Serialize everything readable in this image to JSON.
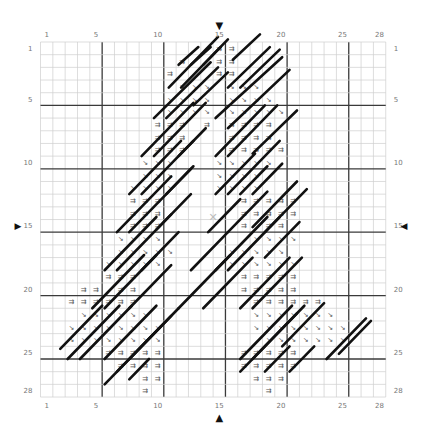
{
  "chart_data": {
    "type": "table",
    "title": "",
    "grid": {
      "cols": 28,
      "rows": 28,
      "bold_every": 5,
      "center_col": 15,
      "center_row": 15
    },
    "col_tick_labels": [
      "1",
      "5",
      "10",
      "15",
      "20",
      "25",
      "28"
    ],
    "row_tick_labels": [
      "1",
      "5",
      "10",
      "15",
      "20",
      "25",
      "28"
    ],
    "symbols": {
      "=": {
        "glyph": "⇉",
        "name": "double-arrow-symbol"
      },
      "\\": {
        "glyph": "↘",
        "name": "diagonal-arrow-symbol"
      }
    },
    "rows": [
      "..............==............",
      "...........=..==............",
      "..........=...==............",
      "...........\\\\\\.\\\\\\..........",
      "..........\\\\\\\\.\\\\\\\\.........",
      "..........\\\\\\\\.\\\\\\\\\\........",
      ".........===.=.====..........",
      ".........===...====.........",
      ".........===...=====........",
      "........\\\\\\...\\\\\\\\\\........",
      "........\\\\\\...\\\\\\\\.........",
      ".......\\\\\\\\...\\\\\\\\.........",
      ".......===......=====.......",
      ".......===......=====.......",
      ".......===......=.==........",
      "......\\\\\\\\.......\\\\\\\\.......",
      "......\\\\\\\\\\....\\\\\\\\\\.......",
      ".....\\\\\\\\\\.....\\\\\\\\\\\\......",
      ".....===........=====.......",
      "...==.==........=====.......",
      "..======.........======.....",
      "...\\\\\\\\\\\\........\\\\\\\\\\\\\\....",
      "..\\\\\\\\\\\\\\\\.......\\\\\\\\\\\\\\\\...",
      "..\\\\\\\\\\\\\\\\........\\\\\\\\\\\\\\...",
      ".....=====......=====.......",
      "......====......=====.......",
      "........==.......===........",
      "........=.........=........."
    ],
    "backstitch_lines": [
      [
        11.2,
        1.8,
        12.8,
        0.4
      ],
      [
        12.2,
        1.8,
        13.8,
        0.4
      ],
      [
        13.2,
        1.8,
        14.6,
        0.4
      ],
      [
        15.6,
        1.4,
        17.8,
        -0.6
      ],
      [
        10.4,
        3.6,
        14.4,
        -0.4
      ],
      [
        11.4,
        3.6,
        15.2,
        -0.2
      ],
      [
        15.2,
        3.6,
        18.6,
        0.4
      ],
      [
        16.2,
        3.6,
        19.4,
        0.6
      ],
      [
        9.2,
        6.0,
        13.8,
        1.6
      ],
      [
        10.2,
        6.0,
        14.4,
        2.0
      ],
      [
        12.4,
        5.0,
        15.2,
        2.4
      ],
      [
        14.2,
        6.0,
        19.6,
        1.2
      ],
      [
        15.2,
        6.8,
        20.2,
        2.2
      ],
      [
        8.2,
        9.0,
        12.4,
        4.8
      ],
      [
        9.2,
        9.0,
        13.4,
        4.8
      ],
      [
        11.2,
        9.0,
        13.4,
        6.8
      ],
      [
        14.2,
        9.0,
        18.2,
        5.0
      ],
      [
        15.2,
        9.0,
        19.2,
        5.0
      ],
      [
        17.2,
        8.8,
        20.8,
        5.4
      ],
      [
        7.2,
        12.0,
        11.4,
        7.8
      ],
      [
        8.2,
        12.0,
        12.4,
        7.8
      ],
      [
        10.2,
        12.0,
        12.4,
        9.8
      ],
      [
        14.2,
        12.0,
        17.4,
        8.8
      ],
      [
        15.2,
        12.0,
        19.4,
        7.8
      ],
      [
        16.2,
        12.0,
        18.4,
        9.8
      ],
      [
        17.2,
        12.0,
        19.6,
        9.6
      ],
      [
        6.2,
        15.0,
        10.6,
        10.6
      ],
      [
        7.2,
        15.0,
        12.2,
        10.0
      ],
      [
        9.4,
        14.8,
        12.2,
        12.0
      ],
      [
        13.6,
        15.0,
        16.2,
        12.4
      ],
      [
        15.2,
        15.0,
        18.4,
        11.8
      ],
      [
        17.2,
        14.6,
        20.8,
        11.0
      ],
      [
        18.2,
        15.0,
        21.6,
        11.6
      ],
      [
        5.2,
        18.0,
        9.4,
        13.8
      ],
      [
        6.2,
        18.0,
        10.6,
        13.6
      ],
      [
        8.2,
        18.0,
        11.2,
        15.0
      ],
      [
        12.2,
        18.0,
        15.2,
        15.0
      ],
      [
        14.2,
        18.0,
        18.4,
        13.8
      ],
      [
        15.2,
        18.0,
        19.4,
        13.8
      ],
      [
        18.2,
        17.0,
        21.0,
        14.2
      ],
      [
        4.2,
        21.0,
        8.4,
        16.8
      ],
      [
        5.2,
        21.0,
        9.4,
        16.8
      ],
      [
        7.2,
        21.0,
        10.6,
        17.6
      ],
      [
        11.2,
        21.0,
        15.4,
        16.8
      ],
      [
        13.2,
        21.0,
        17.2,
        17.0
      ],
      [
        16.2,
        21.0,
        20.2,
        17.0
      ],
      [
        17.2,
        21.0,
        21.2,
        17.0
      ],
      [
        1.6,
        24.2,
        5.0,
        20.8
      ],
      [
        2.2,
        25.0,
        6.4,
        20.8
      ],
      [
        3.2,
        25.0,
        7.4,
        20.8
      ],
      [
        5.2,
        25.0,
        9.4,
        20.8
      ],
      [
        7.2,
        25.0,
        11.2,
        21.0
      ],
      [
        16.2,
        25.0,
        20.4,
        20.8
      ],
      [
        17.2,
        25.0,
        21.4,
        20.8
      ],
      [
        19.6,
        24.0,
        23.0,
        20.6
      ],
      [
        5.2,
        27.0,
        9.8,
        22.4
      ],
      [
        6.2,
        26.0,
        10.6,
        21.6
      ],
      [
        7.2,
        26.6,
        8.8,
        25.0
      ],
      [
        16.2,
        26.0,
        20.8,
        21.4
      ],
      [
        18.2,
        26.0,
        20.2,
        24.0
      ],
      [
        20.2,
        26.0,
        22.2,
        24.0
      ],
      [
        23.2,
        25.0,
        26.4,
        21.8
      ],
      [
        24.2,
        24.6,
        26.8,
        22.0
      ]
    ]
  },
  "markers": {
    "top": "▼",
    "bottom": "▲",
    "left": "▶",
    "right": "◀",
    "center": "✕"
  },
  "colors": {
    "grid_thin": "#cfcfcf",
    "grid_bold": "#3a3a3a",
    "backstitch": "#111111",
    "label": "#777777",
    "center_mark": "#bdbdbd"
  }
}
